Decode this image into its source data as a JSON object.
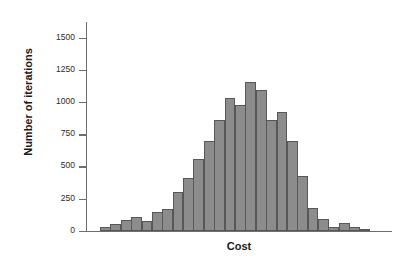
{
  "chart_data": {
    "type": "bar",
    "title": "",
    "subtitle": "",
    "xlabel": "Cost",
    "ylabel": "Number of iterations",
    "ylim": [
      0,
      1625
    ],
    "yticks": [
      0,
      250,
      500,
      750,
      1000,
      1250,
      1500
    ],
    "ytick_labels": [
      "0",
      "250",
      "500",
      "750",
      "1000",
      "1250",
      "1500"
    ],
    "xticks": [],
    "xtick_labels": [],
    "grid": false,
    "legend": null,
    "bar_color": "#8c8c8c",
    "bar_edge_color": "#575757",
    "axis_color": "#6e6e6e",
    "n_bins": 26,
    "categories": [
      "1",
      "2",
      "3",
      "4",
      "5",
      "6",
      "7",
      "8",
      "9",
      "10",
      "11",
      "12",
      "13",
      "14",
      "15",
      "16",
      "17",
      "18",
      "19",
      "20",
      "21",
      "22",
      "23",
      "24",
      "25",
      "26"
    ],
    "values": [
      30,
      58,
      83,
      110,
      78,
      150,
      172,
      305,
      415,
      560,
      700,
      865,
      1040,
      980,
      1160,
      1095,
      865,
      930,
      705,
      425,
      178,
      90,
      30,
      62,
      35,
      8
    ],
    "annotations": []
  },
  "axis": {
    "ylabel": "Number of iterations",
    "xlabel": "Cost"
  }
}
